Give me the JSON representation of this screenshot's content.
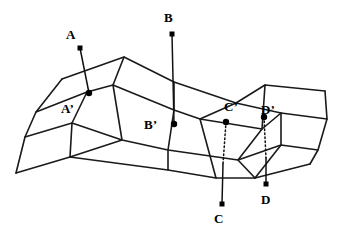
{
  "figure": {
    "background_color": "#ffffff",
    "stroke_color": "#1a1a1a",
    "marker_color": "#000000"
  },
  "labels": {
    "a": "A",
    "b": "B",
    "c": "C",
    "d": "D",
    "a_prime": "A’",
    "b_prime": "B’",
    "c_prime": "C’",
    "d_prime": "D’"
  },
  "label_positions": {
    "a": {
      "x": 66,
      "y": 28
    },
    "b": {
      "x": 164,
      "y": 11
    },
    "c": {
      "x": 214,
      "y": 212
    },
    "d": {
      "x": 261,
      "y": 193
    },
    "a_prime": {
      "x": 61,
      "y": 102
    },
    "b_prime": {
      "x": 144,
      "y": 118
    },
    "c_prime": {
      "x": 224,
      "y": 100
    },
    "d_prime": {
      "x": 261,
      "y": 103
    }
  },
  "square_markers": [
    {
      "name": "marker-a",
      "x": 80,
      "y": 48
    },
    {
      "name": "marker-b",
      "x": 172,
      "y": 34
    },
    {
      "name": "marker-c",
      "x": 222,
      "y": 204
    },
    {
      "name": "marker-d",
      "x": 266,
      "y": 184
    }
  ],
  "dot_markers": [
    {
      "name": "marker-a-prime",
      "x": 89,
      "y": 93
    },
    {
      "name": "marker-b-prime",
      "x": 174,
      "y": 124
    },
    {
      "name": "marker-c-prime",
      "x": 226,
      "y": 122
    },
    {
      "name": "marker-d-prime",
      "x": 264,
      "y": 117
    }
  ],
  "connector_lines": [
    {
      "name": "connector-a",
      "x1": 80,
      "y1": 48,
      "x2": 89,
      "y2": 93,
      "style": "solid"
    },
    {
      "name": "connector-b",
      "x1": 172,
      "y1": 34,
      "x2": 174,
      "y2": 124,
      "style": "solid"
    },
    {
      "name": "connector-c-dotted",
      "x1": 226,
      "y1": 122,
      "x2": 223,
      "y2": 164,
      "style": "dotted"
    },
    {
      "name": "connector-c-solid",
      "x1": 223,
      "y1": 164,
      "x2": 222,
      "y2": 204,
      "style": "solid"
    },
    {
      "name": "connector-d-dotted",
      "x1": 264,
      "y1": 117,
      "x2": 266,
      "y2": 158,
      "style": "dotted"
    },
    {
      "name": "connector-d-solid",
      "x1": 266,
      "y1": 158,
      "x2": 266,
      "y2": 184,
      "style": "solid"
    }
  ],
  "mesh": {
    "description": "Quadrilateral mesh surface drawn as a folded grid of four columns by three rows",
    "polylines": [
      {
        "name": "mesh-row-top",
        "points": "62,79 124,57 174,82 236,103 265,85 325,91"
      },
      {
        "name": "mesh-row-second",
        "points": "36,112 87,92 113,85 174,110 200,119 262,129 281,113 327,119"
      },
      {
        "name": "mesh-row-third",
        "points": "25,137 72,123 122,140 168,150 238,160 281,145 318,150"
      },
      {
        "name": "mesh-row-bottom",
        "points": "16,173 70,157 168,170 216,178 255,178 310,164"
      },
      {
        "name": "mesh-col-left-edge",
        "points": "62,79 36,112 25,137 16,173"
      },
      {
        "name": "mesh-col-a",
        "points": "124,57 113,85 122,140 70,157"
      },
      {
        "name": "mesh-col-b",
        "points": "174,82 174,110 168,150 168,170"
      },
      {
        "name": "mesh-col-c",
        "points": "236,103 200,119 216,178"
      },
      {
        "name": "mesh-col-d",
        "points": "265,85 262,129 238,160 255,178"
      },
      {
        "name": "mesh-col-right-edge",
        "points": "325,91 327,119 318,150 310,164"
      },
      {
        "name": "mesh-fold-a-lower",
        "points": "87,92 72,123 70,157"
      },
      {
        "name": "mesh-fold-c-upper",
        "points": "236,103 281,113 281,145 255,178"
      }
    ]
  }
}
